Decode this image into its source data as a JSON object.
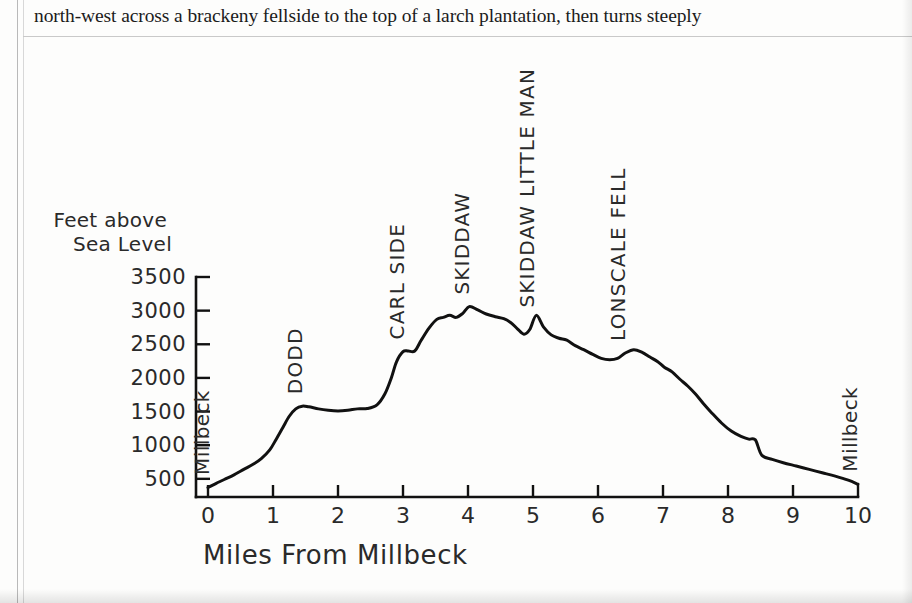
{
  "page": {
    "body_text": "north-west across a brackeny fellside to the top of a larch plantation, then turns steeply"
  },
  "figure": {
    "y_axis_title_line1": "Feet above",
    "y_axis_title_line2": "Sea Level",
    "x_axis_title": "Miles From Millbeck"
  },
  "chart_data": {
    "type": "line",
    "title": "",
    "subtitle": "",
    "xlabel": "Miles From Millbeck",
    "ylabel": "Feet above Sea Level",
    "xlim": [
      0,
      10
    ],
    "ylim": [
      230,
      3500
    ],
    "grid": false,
    "legend": null,
    "x_ticks": [
      0,
      1,
      2,
      3,
      4,
      5,
      6,
      7,
      8,
      9,
      10
    ],
    "x_tick_labels": [
      "0",
      "1",
      "2",
      "3",
      "4",
      "5",
      "6",
      "7",
      "8",
      "9",
      "10"
    ],
    "y_ticks": [
      500,
      1000,
      1500,
      2000,
      2500,
      3000,
      3500
    ],
    "y_tick_labels": [
      "500",
      "1000",
      "1500",
      "2000",
      "2500",
      "3000",
      "3500"
    ],
    "series": [
      {
        "name": "Skiddaw ridge walk elevation profile",
        "x": [
          0.0,
          0.12,
          0.25,
          0.4,
          0.55,
          0.7,
          0.82,
          0.95,
          1.05,
          1.15,
          1.25,
          1.35,
          1.45,
          1.55,
          1.7,
          1.85,
          2.0,
          2.15,
          2.3,
          2.45,
          2.6,
          2.72,
          2.82,
          2.9,
          3.0,
          3.08,
          3.18,
          3.28,
          3.4,
          3.52,
          3.62,
          3.72,
          3.82,
          3.92,
          4.02,
          4.15,
          4.28,
          4.42,
          4.55,
          4.66,
          4.76,
          4.86,
          4.95,
          5.05,
          5.16,
          5.28,
          5.4,
          5.52,
          5.65,
          5.78,
          5.92,
          6.05,
          6.18,
          6.3,
          6.42,
          6.55,
          6.68,
          6.8,
          6.92,
          7.02,
          7.14,
          7.26,
          7.38,
          7.5,
          7.62,
          7.75,
          7.9,
          8.05,
          8.2,
          8.32,
          8.42,
          8.52,
          8.68,
          8.85,
          9.05,
          9.25,
          9.45,
          9.65,
          9.85,
          10.0
        ],
        "y": [
          370,
          430,
          490,
          560,
          640,
          720,
          800,
          930,
          1090,
          1260,
          1430,
          1540,
          1580,
          1570,
          1540,
          1520,
          1510,
          1520,
          1540,
          1545,
          1600,
          1760,
          2000,
          2240,
          2390,
          2400,
          2400,
          2560,
          2740,
          2870,
          2900,
          2930,
          2900,
          2960,
          3060,
          3010,
          2950,
          2910,
          2880,
          2820,
          2730,
          2650,
          2720,
          2930,
          2760,
          2640,
          2590,
          2560,
          2480,
          2420,
          2350,
          2290,
          2270,
          2290,
          2370,
          2420,
          2380,
          2310,
          2240,
          2160,
          2090,
          1980,
          1880,
          1760,
          1620,
          1480,
          1330,
          1210,
          1130,
          1090,
          1080,
          850,
          790,
          740,
          690,
          640,
          590,
          540,
          480,
          420
        ]
      }
    ],
    "peak_annotations": [
      {
        "label": "Millbeck",
        "x": 0.02,
        "orientation": "vertical"
      },
      {
        "label": "DODD",
        "x": 1.45,
        "orientation": "vertical"
      },
      {
        "label": "CARL SIDE",
        "x": 3.02,
        "orientation": "vertical"
      },
      {
        "label": "SKIDDAW",
        "x": 4.02,
        "orientation": "vertical"
      },
      {
        "label": "SKIDDAW LITTLE MAN",
        "x": 5.02,
        "orientation": "vertical"
      },
      {
        "label": "LONSCALE FELL",
        "x": 6.42,
        "orientation": "vertical"
      },
      {
        "label": "Millbeck",
        "x": 9.98,
        "orientation": "vertical"
      }
    ],
    "colors": {
      "line": "#111111",
      "axis": "#111111",
      "text": "#2a2a2a",
      "background": "#fdfdfc"
    }
  }
}
